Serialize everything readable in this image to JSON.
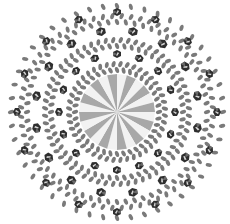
{
  "image": {
    "subject": "beaded mandala",
    "width": 230,
    "height": 224,
    "center": [
      117,
      112
    ],
    "background": "#ffffff",
    "colors": {
      "bead": "#7a7a7a",
      "crystal_dark": "#2e2e2e",
      "crystal_mid": "#6a6a6a",
      "crystal_light": "#d8d8d8",
      "sun_light": "#f2f2f2",
      "sun_dark": "#a8a8a8"
    },
    "sun_rays": 24,
    "sun_radius": 38,
    "petals": 16,
    "crystal_rings": [
      {
        "radius": 58,
        "count": 16,
        "size": 8
      },
      {
        "radius": 82,
        "count": 16,
        "size": 9
      },
      {
        "radius": 100,
        "count": 16,
        "size": 8
      }
    ],
    "bead_rings": [
      {
        "radius": 42,
        "count": 40
      },
      {
        "radius": 48,
        "count": 44
      },
      {
        "radius": 66,
        "count": 56
      },
      {
        "radius": 72,
        "count": 60
      },
      {
        "radius": 90,
        "count": 64
      },
      {
        "radius": 96,
        "count": 64
      },
      {
        "radius": 106,
        "count": 48
      }
    ]
  }
}
